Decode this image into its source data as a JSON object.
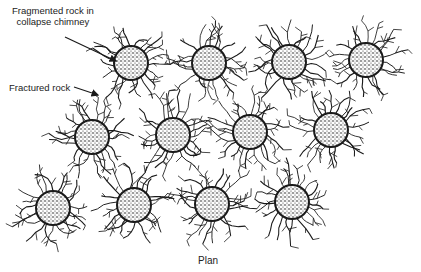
{
  "labels": {
    "fragmented_line1": "Fragmented rock in",
    "fragmented_line2": "collapse chimney",
    "fractured": "Fractured rock",
    "caption": "Plan"
  },
  "chimneys": [
    {
      "x": 131,
      "y": 63
    },
    {
      "x": 209,
      "y": 63
    },
    {
      "x": 289,
      "y": 62
    },
    {
      "x": 366,
      "y": 60
    },
    {
      "x": 92,
      "y": 137
    },
    {
      "x": 173,
      "y": 135
    },
    {
      "x": 250,
      "y": 132
    },
    {
      "x": 331,
      "y": 130
    },
    {
      "x": 53,
      "y": 208
    },
    {
      "x": 134,
      "y": 205
    },
    {
      "x": 212,
      "y": 204
    },
    {
      "x": 292,
      "y": 202
    }
  ],
  "chimney_radius": 17,
  "colors": {
    "ink": "#1a1a1a",
    "background": "#ffffff"
  }
}
